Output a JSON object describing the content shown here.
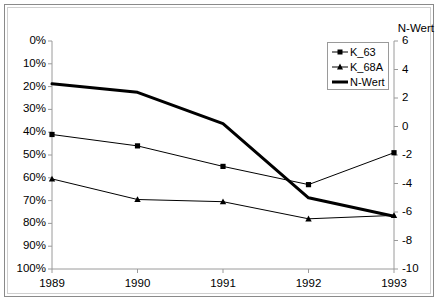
{
  "chart_data": {
    "type": "line",
    "title": "",
    "xlabel": "",
    "ylabel": "",
    "x": [
      "1989",
      "1990",
      "1991",
      "1992",
      "1993"
    ],
    "categories": [
      "1989",
      "1990",
      "1991",
      "1992",
      "1993"
    ],
    "grid": false,
    "legend_position": "top-right",
    "left_axis": {
      "title": "",
      "ticks": [
        "0%",
        "10%",
        "20%",
        "30%",
        "40%",
        "50%",
        "60%",
        "70%",
        "80%",
        "90%",
        "100%"
      ],
      "tick_values": [
        0,
        10,
        20,
        30,
        40,
        50,
        60,
        70,
        80,
        90,
        100
      ],
      "ylim": [
        0,
        100
      ],
      "inverted": true,
      "unit": "%"
    },
    "right_axis": {
      "title": "N-Wert",
      "ticks": [
        "6",
        "4",
        "2",
        "0",
        "-2",
        "-4",
        "-6",
        "-8",
        "-10"
      ],
      "tick_values": [
        6,
        4,
        2,
        0,
        -2,
        -4,
        -6,
        -8,
        -10
      ],
      "ylim": [
        -10,
        6
      ],
      "inverted": false
    },
    "series": [
      {
        "name": "K_63",
        "axis": "left",
        "marker": "square",
        "line_width": 1,
        "color": "#000000",
        "values": [
          41,
          46,
          55,
          63,
          49
        ]
      },
      {
        "name": "K_68A",
        "axis": "left",
        "marker": "triangle",
        "line_width": 1,
        "color": "#000000",
        "values": [
          60.5,
          69.5,
          70.5,
          78,
          76.5
        ]
      },
      {
        "name": "N-Wert",
        "axis": "right",
        "marker": "none",
        "line_width": 3,
        "color": "#000000",
        "values": [
          3.0,
          2.4,
          0.2,
          -5.0,
          -6.3
        ]
      }
    ]
  },
  "legend": {
    "items": [
      {
        "label": "K_63"
      },
      {
        "label": "K_68A"
      },
      {
        "label": "N-Wert"
      }
    ]
  },
  "colors": {
    "line": "#000000",
    "axis": "#9a9a9a",
    "border": "#8a8a8a",
    "background": "#ffffff"
  }
}
